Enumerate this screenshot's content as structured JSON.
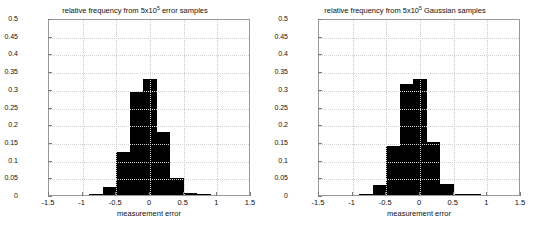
{
  "figure": {
    "background": "#ffffff",
    "bar_color": "#000000",
    "axis_color": "#9a9a9a",
    "grid_color": "#c9c9c9"
  },
  "panels": [
    {
      "id": "left",
      "title_prefix": "relative frequency from 5x10",
      "title_exponent": "5",
      "title_suffix": " error samples",
      "xlabel": "measurement error",
      "ylabel": "",
      "xticks": [
        "-1.5",
        "-1",
        "-0.5",
        "0",
        "0.5",
        "1",
        "1.5"
      ],
      "xtick_values": [
        -1.5,
        -1,
        -0.5,
        0,
        0.5,
        1,
        1.5
      ],
      "yticks": [
        "0",
        "0.05",
        "0.1",
        "0.15",
        "0.2",
        "0.25",
        "0.3",
        "0.35",
        "0.4",
        "0.45",
        "0.5"
      ],
      "ytick_values": [
        0,
        0.05,
        0.1,
        0.15,
        0.2,
        0.25,
        0.3,
        0.35,
        0.4,
        0.45,
        0.5
      ]
    },
    {
      "id": "right",
      "title_prefix": "relative frequency from 5x10",
      "title_exponent": "5",
      "title_suffix": " Gaussian samples",
      "xlabel": "measurement error",
      "ylabel": "",
      "xticks": [
        "-1.5",
        "-1",
        "-0.5",
        "0",
        "0.5",
        "1",
        "1.5"
      ],
      "xtick_values": [
        -1.5,
        -1,
        -0.5,
        0,
        0.5,
        1,
        1.5
      ],
      "yticks": [
        "0",
        "0.05",
        "0.1",
        "0.15",
        "0.2",
        "0.25",
        "0.3",
        "0.35",
        "0.4",
        "0.45",
        "0.5"
      ],
      "ytick_values": [
        0,
        0.05,
        0.1,
        0.15,
        0.2,
        0.25,
        0.3,
        0.35,
        0.4,
        0.45,
        0.5
      ]
    }
  ],
  "chart_data": [
    {
      "type": "bar",
      "title": "relative frequency from 5x10^5 error samples",
      "xlabel": "measurement error",
      "ylabel": "",
      "xlim": [
        -1.5,
        1.5
      ],
      "ylim": [
        0,
        0.5
      ],
      "grid": true,
      "bin_width": 0.2,
      "bin_edges": [
        -0.9,
        -0.7,
        -0.5,
        -0.3,
        -0.1,
        0.1,
        0.3,
        0.5,
        0.7,
        0.9
      ],
      "bin_centers": [
        -0.8,
        -0.6,
        -0.4,
        -0.2,
        0.0,
        0.2,
        0.4,
        0.6,
        0.8
      ],
      "values": [
        0.002,
        0.024,
        0.122,
        0.29,
        0.327,
        0.178,
        0.047,
        0.006,
        0.002
      ]
    },
    {
      "type": "bar",
      "title": "relative frequency from 5x10^5 Gaussian samples",
      "xlabel": "measurement error",
      "ylabel": "",
      "xlim": [
        -1.5,
        1.5
      ],
      "ylim": [
        0,
        0.5
      ],
      "grid": true,
      "bin_width": 0.2,
      "bin_edges": [
        -0.9,
        -0.7,
        -0.5,
        -0.3,
        -0.1,
        0.1,
        0.3,
        0.5,
        0.7,
        0.9
      ],
      "bin_centers": [
        -0.8,
        -0.6,
        -0.4,
        -0.2,
        0.0,
        0.2,
        0.4,
        0.6,
        0.8
      ],
      "values": [
        0.003,
        0.028,
        0.139,
        0.315,
        0.327,
        0.151,
        0.032,
        0.004,
        0.002
      ]
    }
  ]
}
